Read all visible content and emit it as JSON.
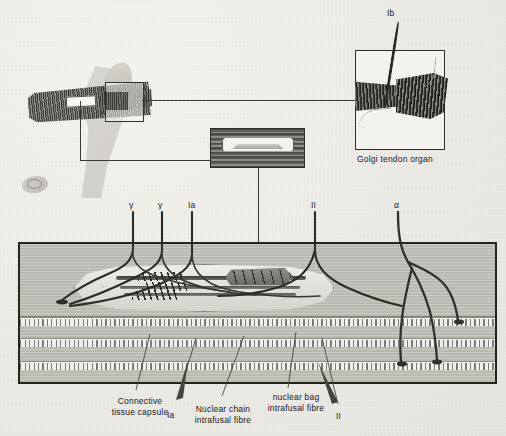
{
  "figure": {
    "background_color": "#efeeea",
    "ink_color": "#23231f"
  },
  "insets": {
    "golgi": {
      "caption": "Golgi tendon organ",
      "afferent_label": "Ib"
    },
    "muscle_overview": {
      "spindle_window_name": "muscle spindle site",
      "tendon_box_name": "tendon organ site"
    },
    "spindle_inset": {
      "name": "muscle spindle in situ"
    }
  },
  "top_labels": [
    {
      "text": "γ",
      "name": "gamma-efferent-1",
      "x": 129,
      "y": 200
    },
    {
      "text": "γ",
      "name": "gamma-efferent-2",
      "x": 158,
      "y": 200
    },
    {
      "text": "Ia",
      "name": "ia-afferent-top",
      "x": 188,
      "y": 200
    },
    {
      "text": "II",
      "name": "ii-afferent-top",
      "x": 311,
      "y": 200
    },
    {
      "text": "α",
      "name": "alpha-motor-top",
      "x": 394,
      "y": 200
    }
  ],
  "bottom_labels": [
    {
      "text": "Connective\ntissue capsule",
      "name": "connective-tissue-capsule",
      "x": 103,
      "y": 396
    },
    {
      "text": "Ia",
      "name": "ia-afferent-bottom",
      "x": 167,
      "y": 410
    },
    {
      "text": "Nuclear chain\nintrafusal fibre",
      "name": "nuclear-chain-intrafusal-fibre",
      "x": 183,
      "y": 404
    },
    {
      "text": "nuclear bag\nintrafusal fibre",
      "name": "nuclear-bag-intrafusal-fibre",
      "x": 258,
      "y": 392
    },
    {
      "text": "II",
      "name": "ii-afferent-bottom",
      "x": 336,
      "y": 411
    }
  ],
  "panel": {
    "name": "muscle-spindle-detail-panel",
    "structures": [
      "connective tissue capsule",
      "nuclear bag intrafusal fibre",
      "nuclear chain intrafusal fibre",
      "annulospiral (primary) ending",
      "flower-spray (secondary) ending",
      "extrafusal striated muscle fibres",
      "alpha motor end plates"
    ]
  }
}
